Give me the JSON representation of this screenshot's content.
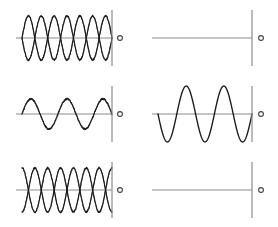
{
  "figure": {
    "title": "",
    "background_color": "#ffffff",
    "width": 278,
    "height": 227,
    "line_color": "#1a1a1a",
    "axis_color": "#8c8c8c",
    "marker_color": "#404040"
  },
  "chart_data": {
    "type": "line",
    "title": "",
    "subtitle": "",
    "xlabel": "",
    "ylabel": "",
    "grid": false,
    "legend": "none",
    "layout": {
      "rows": 3,
      "cols": 2
    },
    "xlim": [
      0,
      1
    ],
    "ylim": [
      -1,
      1
    ],
    "panels": [
      {
        "id": "panel-r1c1",
        "row": 1,
        "col": 1,
        "kind": "beat-envelope",
        "description": "two mirrored textured waves crossing repeatedly",
        "baseline_y": 38,
        "x_start": 22,
        "x_end": 112,
        "amplitude": 22,
        "cycles": 3.5,
        "phase": 0,
        "textured": true,
        "series": [
          {
            "name": "wave-upper",
            "amplitude": 22,
            "cycles": 3.5,
            "phase": 0
          },
          {
            "name": "wave-lower",
            "amplitude": 22,
            "cycles": 3.5,
            "phase": 3.14159
          }
        ],
        "axis_bar_x": 112,
        "marker_x": 120,
        "bar_top": 10,
        "bar_bottom": 66
      },
      {
        "id": "panel-r1c2",
        "row": 1,
        "col": 2,
        "kind": "flat",
        "description": "flat zero line",
        "baseline_y": 38,
        "x_start": 158,
        "x_end": 252,
        "amplitude": 0,
        "cycles": 0,
        "phase": 0,
        "textured": false,
        "series": [
          {
            "name": "flat-line",
            "amplitude": 0,
            "cycles": 0,
            "phase": 0
          }
        ],
        "axis_bar_x": 252,
        "marker_x": 261,
        "bar_top": 10,
        "bar_bottom": 66
      },
      {
        "id": "panel-r2c1",
        "row": 2,
        "col": 1,
        "kind": "single-wave",
        "description": "single textured low amplitude sine",
        "baseline_y": 114,
        "x_start": 22,
        "x_end": 112,
        "amplitude": 15,
        "cycles": 2.5,
        "phase": 0,
        "textured": true,
        "series": [
          {
            "name": "wave",
            "amplitude": 15,
            "cycles": 2.5,
            "phase": 0
          }
        ],
        "axis_bar_x": 112,
        "marker_x": 120,
        "bar_top": 86,
        "bar_bottom": 142
      },
      {
        "id": "panel-r2c2",
        "row": 2,
        "col": 2,
        "kind": "single-wave",
        "description": "smooth large amplitude sine, inverted start",
        "baseline_y": 114,
        "x_start": 158,
        "x_end": 252,
        "amplitude": 28,
        "cycles": 2.5,
        "phase": 3.14159,
        "textured": false,
        "series": [
          {
            "name": "wave",
            "amplitude": 28,
            "cycles": 2.5,
            "phase": 3.14159
          }
        ],
        "axis_bar_x": 252,
        "marker_x": 261,
        "bar_top": 86,
        "bar_bottom": 142
      },
      {
        "id": "panel-r3c1",
        "row": 3,
        "col": 1,
        "kind": "beat-envelope",
        "description": "two mirrored textured waves crossing repeatedly",
        "baseline_y": 190,
        "x_start": 22,
        "x_end": 112,
        "amplitude": 22,
        "cycles": 3.5,
        "phase": 1.5708,
        "textured": true,
        "series": [
          {
            "name": "wave-upper",
            "amplitude": 22,
            "cycles": 3.5,
            "phase": 1.5708
          },
          {
            "name": "wave-lower",
            "amplitude": 22,
            "cycles": 3.5,
            "phase": 4.71239
          }
        ],
        "axis_bar_x": 112,
        "marker_x": 120,
        "bar_top": 162,
        "bar_bottom": 218
      },
      {
        "id": "panel-r3c2",
        "row": 3,
        "col": 2,
        "kind": "flat",
        "description": "flat zero line",
        "baseline_y": 190,
        "x_start": 158,
        "x_end": 252,
        "amplitude": 0,
        "cycles": 0,
        "phase": 0,
        "textured": false,
        "series": [
          {
            "name": "flat-line",
            "amplitude": 0,
            "cycles": 0,
            "phase": 0
          }
        ],
        "axis_bar_x": 252,
        "marker_x": 261,
        "bar_top": 162,
        "bar_bottom": 218
      }
    ]
  }
}
